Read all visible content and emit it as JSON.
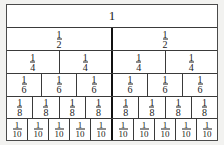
{
  "diagram": {
    "type": "fraction-wall",
    "whole_label": "1",
    "colors": {
      "page_background": "#f2f2f0",
      "cell_background": "#ffffff",
      "border": "#3a3a3a",
      "heavy_divider": "#111111",
      "text": "#1a1a1a"
    },
    "rows": [
      {
        "name": "row-whole",
        "denominator": 1,
        "count": 1,
        "label_type": "whole",
        "numerator": "1",
        "denominator_text": "",
        "cells": [
          "1"
        ]
      },
      {
        "name": "row-halves",
        "denominator": 2,
        "count": 2,
        "label_type": "fraction",
        "numerator": "1",
        "denominator_text": "2",
        "cells": [
          "1/2",
          "1/2"
        ]
      },
      {
        "name": "row-quarters",
        "denominator": 4,
        "count": 4,
        "label_type": "fraction",
        "numerator": "1",
        "denominator_text": "4",
        "cells": [
          "1/4",
          "1/4",
          "1/4",
          "1/4"
        ]
      },
      {
        "name": "row-sixths",
        "denominator": 6,
        "count": 6,
        "label_type": "fraction",
        "numerator": "1",
        "denominator_text": "6",
        "cells": [
          "1/6",
          "1/6",
          "1/6",
          "1/6",
          "1/6",
          "1/6"
        ]
      },
      {
        "name": "row-eighths",
        "denominator": 8,
        "count": 8,
        "label_type": "fraction",
        "numerator": "1",
        "denominator_text": "8",
        "cells": [
          "1/8",
          "1/8",
          "1/8",
          "1/8",
          "1/8",
          "1/8",
          "1/8",
          "1/8"
        ]
      },
      {
        "name": "row-tenths",
        "denominator": 10,
        "count": 10,
        "label_type": "fraction",
        "numerator": "1",
        "denominator_text": "10",
        "cells": [
          "1/10",
          "1/10",
          "1/10",
          "1/10",
          "1/10",
          "1/10",
          "1/10",
          "1/10",
          "1/10",
          "1/10"
        ]
      }
    ]
  }
}
